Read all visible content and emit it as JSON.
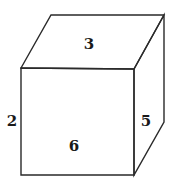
{
  "diagram": {
    "type": "cube",
    "vertices": {
      "front_top_left": [
        21,
        68
      ],
      "front_top_right": [
        134,
        69
      ],
      "front_bottom_left": [
        21,
        175
      ],
      "front_bottom_right": [
        134,
        175
      ],
      "back_top_left": [
        51,
        15
      ],
      "back_top_right": [
        164,
        15
      ],
      "back_bottom_right": [
        164,
        122
      ]
    },
    "labels": {
      "top": "3",
      "front": "6",
      "left": "2",
      "right": "5"
    },
    "label_positions": {
      "top": [
        89,
        44
      ],
      "front": [
        74,
        146
      ],
      "left": [
        12,
        121
      ],
      "right": [
        146,
        121
      ]
    },
    "colors": {
      "stroke": "#2a2a2a",
      "text": "#1a1a1a",
      "background": "#ffffff"
    }
  }
}
